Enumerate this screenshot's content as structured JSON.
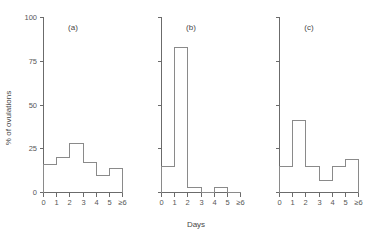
{
  "chart_data": {
    "type": "bar",
    "title": "",
    "xlabel": "Days",
    "ylabel": "% of ovulations",
    "ylim": [
      0,
      100
    ],
    "yticks": [
      0,
      25,
      50,
      75,
      100
    ],
    "ytick_labels": [
      "0",
      "25",
      "50",
      "75",
      "100"
    ],
    "grid": false,
    "legend": "none",
    "bin_edges": [
      0,
      1,
      2,
      3,
      4,
      5,
      6
    ],
    "xtick_labels": [
      "0",
      "1",
      "2",
      "3",
      "4",
      "5",
      "≥6"
    ],
    "panels": [
      {
        "id": "a",
        "label": "(a)",
        "categories": [
          "0-1",
          "1-2",
          "2-3",
          "3-4",
          "4-5",
          "5-≥6"
        ],
        "values": [
          16,
          20,
          28,
          17,
          10,
          14
        ]
      },
      {
        "id": "b",
        "label": "(b)",
        "categories": [
          "0-1",
          "1-2",
          "2-3",
          "3-4",
          "4-5",
          "5-≥6"
        ],
        "values": [
          15,
          83,
          3,
          0,
          3,
          0
        ]
      },
      {
        "id": "c",
        "label": "(c)",
        "categories": [
          "0-1",
          "1-2",
          "2-3",
          "3-4",
          "4-5",
          "5-≥6"
        ],
        "values": [
          15,
          41,
          15,
          7,
          15,
          19
        ]
      }
    ]
  },
  "axes": {
    "ylabel": "% of ovulations",
    "xlabel": "Days"
  }
}
